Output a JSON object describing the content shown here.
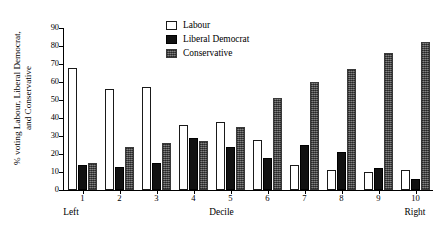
{
  "chart_data": {
    "type": "bar",
    "title": "",
    "xlabel": "Decile",
    "ylabel_line1": "% voting Labour, Liberal Democrat,",
    "ylabel_line2": "and Conservative",
    "x_axis_end_left": "Left",
    "x_axis_end_right": "Right",
    "categories": [
      "1",
      "2",
      "3",
      "4",
      "5",
      "6",
      "7",
      "8",
      "9",
      "10"
    ],
    "ylim": [
      0,
      90
    ],
    "yticks": [
      0,
      10,
      20,
      30,
      40,
      50,
      60,
      70,
      80,
      90
    ],
    "ytick_labels": [
      "0",
      "10",
      "20",
      "30",
      "40",
      "50",
      "60",
      "70",
      "80",
      "90"
    ],
    "grid": false,
    "legend_position": "top-center",
    "series": [
      {
        "name": "Labour",
        "color": "#ffffff",
        "edge_color": "#1a1a1a",
        "values": [
          68,
          56,
          57,
          36,
          38,
          28,
          14,
          11,
          10,
          11
        ]
      },
      {
        "name": "Liberal Democrat",
        "color": "#111111",
        "edge_color": "#000000",
        "values": [
          14,
          13,
          15,
          29,
          24,
          18,
          25,
          21,
          12,
          6
        ]
      },
      {
        "name": "Conservative",
        "color": "#5b5b5b",
        "edge_color": "#3a3a3a",
        "values": [
          15,
          24,
          26,
          27,
          35,
          51,
          60,
          67,
          76,
          82
        ]
      }
    ]
  },
  "legend": {
    "items": [
      {
        "label": "Labour",
        "key": "labour"
      },
      {
        "label": "Liberal Democrat",
        "key": "libdem"
      },
      {
        "label": "Conservative",
        "key": "cons"
      }
    ]
  }
}
